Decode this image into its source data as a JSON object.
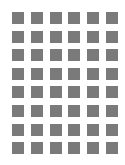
{
  "grid": {
    "columns": 6,
    "rows": 8,
    "cell_color": "#7a7a7a",
    "background": "#ffffff"
  }
}
